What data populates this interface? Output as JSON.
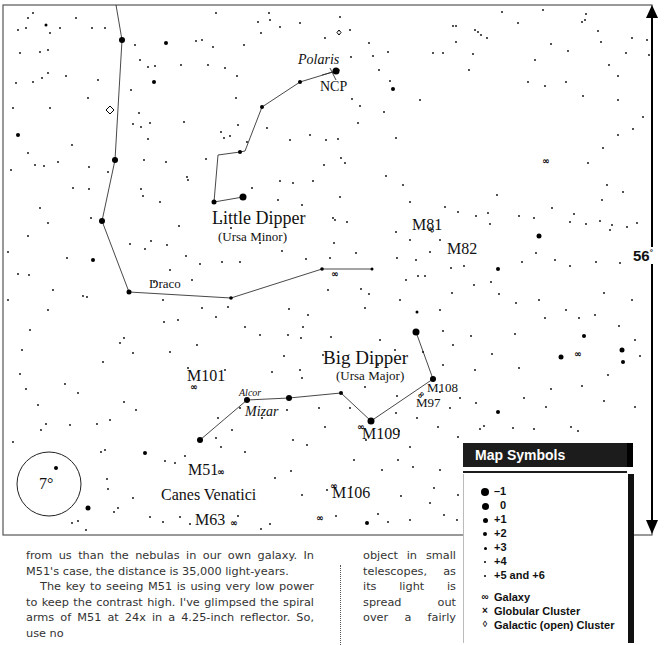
{
  "map": {
    "labels": {
      "polaris": "Polaris",
      "ncp": "NCP",
      "little_dipper": "Little Dipper",
      "ursa_minor": "(Ursa Minor)",
      "draco": "Draco",
      "m81": "M81",
      "m82": "M82",
      "big_dipper": "Big Dipper",
      "ursa_major": "(Ursa Major)",
      "m101": "M101",
      "alcor": "Alcor",
      "mizar": "Mizar",
      "m108": "M108",
      "m97": "M97",
      "m109": "M109",
      "m51": "M51",
      "canes_venatici": "Canes Venatici",
      "m106": "M106",
      "m63": "M63",
      "scale_circle": "7°",
      "scale_bar": "56",
      "scale_bar_unit": "°"
    }
  },
  "legend": {
    "title": "Map Symbols",
    "magnitudes": [
      {
        "label": "–1",
        "size": 8
      },
      {
        "label": "0",
        "size": 7
      },
      {
        "label": "+1",
        "size": 5
      },
      {
        "label": "+2",
        "size": 4
      },
      {
        "label": "+3",
        "size": 3
      },
      {
        "label": "+4",
        "size": 2.5
      },
      {
        "label": "+5 and +6",
        "size": 2
      }
    ],
    "objects": [
      {
        "label": "Galaxy",
        "icon": "galaxy-icon",
        "glyph": "∞"
      },
      {
        "label": "Globular Cluster",
        "icon": "globular-cluster-icon",
        "glyph": "×"
      },
      {
        "label": "Galactic (open) Cluster",
        "icon": "open-cluster-icon",
        "glyph": "◊"
      }
    ]
  },
  "article": {
    "left_col": [
      "from us than the nebulas in our own galaxy. In M51's case, the distance is 35,000 light-years.",
      "The key to seeing M51 is using very low power to keep the contrast high. I've glimpsed the spiral arms of M51 at 24x in a 4.25-inch reflector. So, use no"
    ],
    "right_col": [
      "object in small",
      "telescopes, as",
      "its light is",
      "spread out",
      "over a fairly"
    ]
  }
}
